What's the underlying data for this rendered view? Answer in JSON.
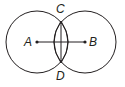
{
  "diagram": {
    "stroke_color": "#231f20",
    "background": "#ffffff",
    "circles": [
      {
        "name": "circle-a",
        "cx": 37,
        "cy": 42,
        "r": 31
      },
      {
        "name": "circle-b",
        "cx": 85,
        "cy": 42,
        "r": 31
      }
    ],
    "points": {
      "A": {
        "label": "A",
        "x": 37,
        "y": 42
      },
      "B": {
        "label": "B",
        "x": 85,
        "y": 42
      },
      "C": {
        "label": "C",
        "x": 61,
        "y": 21
      },
      "D": {
        "label": "D",
        "x": 61,
        "y": 63
      }
    },
    "segments": [
      {
        "name": "segment-ab",
        "from": "A",
        "to": "B"
      },
      {
        "name": "segment-cd",
        "from": "C",
        "to": "D"
      }
    ]
  }
}
